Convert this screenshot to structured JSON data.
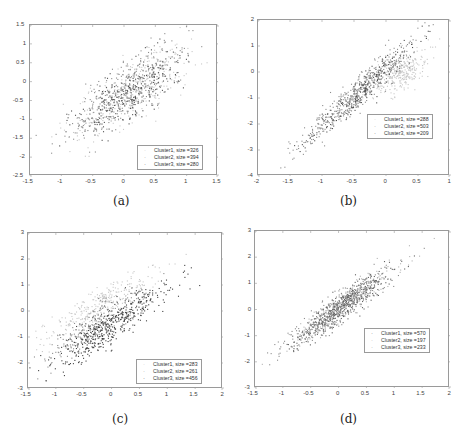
{
  "chart_data": [
    {
      "type": "scatter",
      "id": "a",
      "caption": "(a)",
      "xlim": [
        -1.5,
        1.5
      ],
      "ylim": [
        -2.5,
        1.5
      ],
      "xticks": [
        "-1.5",
        "-1",
        "-0.5",
        "0",
        "0.5",
        "1",
        "1.5"
      ],
      "yticks": [
        "1.5",
        "1",
        "0.5",
        "0",
        "-0.5",
        "-1",
        "-1.5",
        "-2",
        "-2.5"
      ],
      "legend_position": "lower right",
      "series": [
        {
          "name": "Cluster1, size =326",
          "size": 326,
          "color": "#c8c8c8",
          "cx": 0.15,
          "cy": -0.2,
          "sx": 0.5,
          "slope": 1.05,
          "noise": 0.4
        },
        {
          "name": "Cluster2, size =394",
          "size": 394,
          "color": "#8c8c8c",
          "cx": 0.0,
          "cy": -0.3,
          "sx": 0.45,
          "slope": 1.1,
          "noise": 0.35
        },
        {
          "name": "Cluster3, size =280",
          "size": 280,
          "color": "#505050",
          "cx": 0.1,
          "cy": -0.3,
          "sx": 0.4,
          "slope": 1.0,
          "noise": 0.35
        }
      ]
    },
    {
      "type": "scatter",
      "id": "b",
      "caption": "(b)",
      "xlim": [
        -2,
        1
      ],
      "ylim": [
        -4,
        2
      ],
      "xticks": [
        "-2",
        "-1.5",
        "-1",
        "-0.5",
        "0",
        "0.5",
        "1"
      ],
      "yticks": [
        "2",
        "1",
        "0",
        "-1",
        "-2",
        "-3",
        "-4"
      ],
      "legend_position": "middle right",
      "series": [
        {
          "name": "Cluster1, size =288",
          "size": 288,
          "color": "#c8c8c8",
          "cx": 0.25,
          "cy": 0.0,
          "sx": 0.2,
          "slope": 1.2,
          "noise": 0.35
        },
        {
          "name": "Cluster2, size =503",
          "size": 503,
          "color": "#8c8c8c",
          "cx": -0.45,
          "cy": -0.8,
          "sx": 0.45,
          "slope": 2.2,
          "noise": 0.3
        },
        {
          "name": "Cluster3, size =209",
          "size": 209,
          "color": "#505050",
          "cx": -0.3,
          "cy": -0.6,
          "sx": 0.45,
          "slope": 2.2,
          "noise": 0.3
        }
      ]
    },
    {
      "type": "scatter",
      "id": "c",
      "caption": "(c)",
      "xlim": [
        -1.5,
        2
      ],
      "ylim": [
        -3,
        3
      ],
      "xticks": [
        "-1.5",
        "-1",
        "-0.5",
        "0",
        "0.5",
        "1",
        "1.5",
        "2"
      ],
      "yticks": [
        "3",
        "2",
        "1",
        "0",
        "-1",
        "-2",
        "-3"
      ],
      "legend_position": "lower right",
      "series": [
        {
          "name": "Cluster1, size =283",
          "size": 283,
          "color": "#c8c8c8",
          "cx": -0.2,
          "cy": 0.2,
          "sx": 0.5,
          "slope": 1.2,
          "noise": 0.3
        },
        {
          "name": "Cluster2, size =261",
          "size": 261,
          "color": "#8c8c8c",
          "cx": -0.3,
          "cy": -0.6,
          "sx": 0.45,
          "slope": 1.3,
          "noise": 0.35
        },
        {
          "name": "Cluster3, size =456",
          "size": 456,
          "color": "#404040",
          "cx": 0.0,
          "cy": -0.5,
          "sx": 0.5,
          "slope": 1.4,
          "noise": 0.35
        }
      ]
    },
    {
      "type": "scatter",
      "id": "d",
      "caption": "(d)",
      "xlim": [
        -1.5,
        2
      ],
      "ylim": [
        -3,
        3
      ],
      "xticks": [
        "-1.5",
        "-1",
        "-0.5",
        "0",
        "0.5",
        "1",
        "1.5",
        "2"
      ],
      "yticks": [
        "3",
        "2",
        "1",
        "0",
        "-1",
        "-2",
        "-3"
      ],
      "legend_position": "middle right",
      "series": [
        {
          "name": "Cluster1, size =570",
          "size": 570,
          "color": "#606060",
          "cx": 0.05,
          "cy": 0.1,
          "sx": 0.4,
          "slope": 1.55,
          "noise": 0.25
        },
        {
          "name": "Cluster2, size =197",
          "size": 197,
          "color": "#b4b4b4",
          "cx": 0.1,
          "cy": 0.2,
          "sx": 0.5,
          "slope": 1.5,
          "noise": 0.3
        },
        {
          "name": "Cluster3, size =233",
          "size": 233,
          "color": "#8c8c8c",
          "cx": 0.0,
          "cy": 0.0,
          "sx": 0.5,
          "slope": 1.5,
          "noise": 0.3
        }
      ]
    }
  ],
  "layout": [
    {
      "plot": {
        "left": 29,
        "top": 24,
        "width": 188,
        "height": 151
      },
      "legend": {
        "left": 137,
        "top": 145
      },
      "caption": {
        "left": 113,
        "top": 194
      }
    },
    {
      "plot": {
        "left": 257,
        "top": 19,
        "width": 192,
        "height": 156
      },
      "legend": {
        "left": 367,
        "top": 114
      },
      "caption": {
        "left": 340,
        "top": 194
      }
    },
    {
      "plot": {
        "left": 27,
        "top": 232,
        "width": 195,
        "height": 156
      },
      "legend": {
        "left": 136,
        "top": 359
      },
      "caption": {
        "left": 112,
        "top": 412
      }
    },
    {
      "plot": {
        "left": 254,
        "top": 230,
        "width": 195,
        "height": 157
      },
      "legend": {
        "left": 364,
        "top": 328
      },
      "caption": {
        "left": 340,
        "top": 412
      }
    }
  ]
}
